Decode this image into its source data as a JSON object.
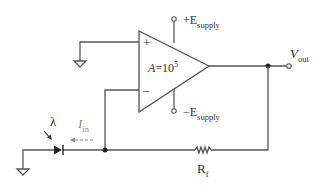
{
  "diagram": {
    "type": "circuit-schematic",
    "opamp": {
      "gain_label": "A=10",
      "gain_exp": "5",
      "plus_symbol": "+",
      "minus_symbol": "−"
    },
    "supply_pos": {
      "prefix": "+E",
      "sub": "supply"
    },
    "supply_neg": {
      "prefix": "−E",
      "sub": "supply"
    },
    "output": {
      "main": "V",
      "sub": "out"
    },
    "light": {
      "symbol": "λ"
    },
    "current": {
      "main": "I",
      "sub": "in"
    },
    "resistor": {
      "main": "R",
      "sub": "f"
    },
    "colors": {
      "wire": "#555555",
      "text": "#333333",
      "current_arrow": "#888888"
    }
  }
}
